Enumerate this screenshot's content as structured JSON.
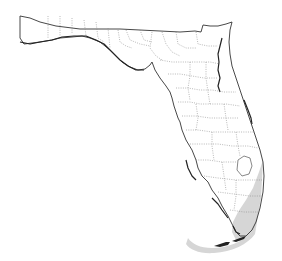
{
  "map": {
    "region": "Florida",
    "type": "distribution range map",
    "features": {
      "state_outline": "Florida state boundary",
      "county_lines": "dotted county boundaries",
      "shaded_range": "southeastern Florida coast and Florida Keys"
    },
    "colors": {
      "background": "#ffffff",
      "outline": "#333333",
      "county_lines": "#8a8a8a",
      "range_fill": "#d6d6d6"
    }
  }
}
